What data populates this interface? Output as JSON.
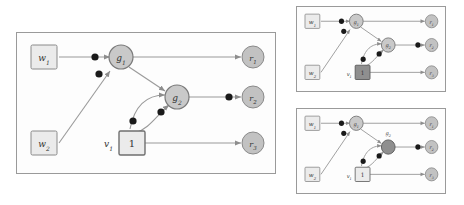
{
  "figure": {
    "type": "computation-graph-diagram",
    "panel_count": 3,
    "colors": {
      "node_fill": "#c9c9c9",
      "node_fill_highlight": "#8f8f8f",
      "node_stroke": "#7a7a7a",
      "box_fill": "#ebebeb",
      "box_fill_highlight": "#8f8f8f",
      "box_stroke": "#8a8a8a",
      "edge": "#9a9a9a",
      "dot": "#1a1a1a",
      "panel_border": "#9a9a9a",
      "panel_bg": "#fdfdfd",
      "text": "#333333"
    }
  },
  "main_panel": {
    "name": "main-graph-panel",
    "inputs": [
      {
        "id": "w1",
        "label": "w",
        "sub": "1",
        "kind": "box"
      },
      {
        "id": "w2",
        "label": "w",
        "sub": "2",
        "kind": "box"
      }
    ],
    "constant": {
      "id": "v1",
      "label": "v",
      "sub": "1",
      "value": "1",
      "kind": "box"
    },
    "gates": [
      {
        "id": "g1",
        "label": "g",
        "sub": "1",
        "kind": "circle",
        "highlight": false
      },
      {
        "id": "g2",
        "label": "g",
        "sub": "2",
        "kind": "circle",
        "highlight": false
      }
    ],
    "outputs": [
      {
        "id": "r1",
        "label": "r",
        "sub": "1",
        "kind": "circle"
      },
      {
        "id": "r2",
        "label": "r",
        "sub": "2",
        "kind": "circle"
      },
      {
        "id": "r3",
        "label": "r",
        "sub": "3",
        "kind": "circle"
      }
    ],
    "edges": [
      {
        "from": "w1",
        "to": "g1",
        "dot": true
      },
      {
        "from": "w2",
        "to": "g1",
        "dot": true
      },
      {
        "from": "g1",
        "to": "r1",
        "dot": false
      },
      {
        "from": "g1",
        "to": "g2",
        "dot": false
      },
      {
        "from": "v1",
        "to": "g2",
        "dot": true,
        "curved": true
      },
      {
        "from": "v1",
        "to": "g2",
        "dot": true,
        "curved": true,
        "second": true
      },
      {
        "from": "g2",
        "to": "r2",
        "dot": true
      },
      {
        "from": "v1",
        "to": "r3",
        "dot": false
      }
    ]
  },
  "inset_panels": [
    {
      "name": "inset-panel-top",
      "highlight": "v1",
      "inputs": [
        {
          "id": "w1",
          "label": "w",
          "sub": "1"
        },
        {
          "id": "w2",
          "label": "w",
          "sub": "2"
        }
      ],
      "constant": {
        "id": "v1",
        "label": "v",
        "sub": "1",
        "value": "1",
        "highlight": true
      },
      "gates": [
        {
          "id": "g1",
          "label": "g",
          "sub": "1",
          "highlight": false
        },
        {
          "id": "g2",
          "label": "g",
          "sub": "2",
          "highlight": false
        }
      ],
      "outputs": [
        {
          "id": "r1",
          "label": "r",
          "sub": "1"
        },
        {
          "id": "r2",
          "label": "r",
          "sub": "2"
        },
        {
          "id": "r3",
          "label": "r",
          "sub": "3"
        }
      ]
    },
    {
      "name": "inset-panel-bottom",
      "highlight": "g2",
      "inputs": [
        {
          "id": "w1",
          "label": "w",
          "sub": "1"
        },
        {
          "id": "w2",
          "label": "w",
          "sub": "2"
        }
      ],
      "constant": {
        "id": "v1",
        "label": "v",
        "sub": "1",
        "value": "1",
        "highlight": false
      },
      "gates": [
        {
          "id": "g1",
          "label": "g",
          "sub": "1",
          "highlight": false
        },
        {
          "id": "g2",
          "label": "g",
          "sub": "2",
          "highlight": true
        }
      ],
      "outputs": [
        {
          "id": "r1",
          "label": "r",
          "sub": "1"
        },
        {
          "id": "r2",
          "label": "r",
          "sub": "2"
        },
        {
          "id": "r3",
          "label": "r",
          "sub": "3"
        }
      ]
    }
  ]
}
